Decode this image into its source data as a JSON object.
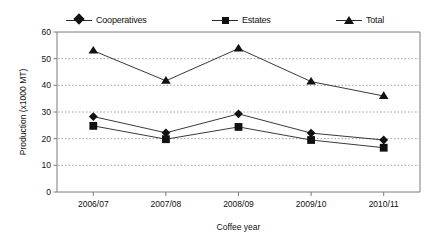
{
  "chart_data": {
    "type": "line",
    "title": "",
    "xlabel": "Coffee year",
    "ylabel": "Production (x1000 MT)",
    "categories": [
      "2006/07",
      "2007/08",
      "2008/09",
      "2009/10",
      "2010/11"
    ],
    "series": [
      {
        "name": "Cooperatives",
        "marker": "diamond",
        "values": [
          28.3,
          22.2,
          29.3,
          22.1,
          19.5
        ]
      },
      {
        "name": "Estates",
        "marker": "square",
        "values": [
          24.8,
          19.8,
          24.4,
          19.5,
          16.6
        ]
      },
      {
        "name": "Total",
        "marker": "triangle",
        "values": [
          53.0,
          41.7,
          53.8,
          41.4,
          36.0
        ]
      }
    ],
    "ylim": [
      0,
      60
    ],
    "ytick_values": [
      0,
      10,
      20,
      30,
      40,
      50,
      60
    ],
    "ytick_labels": [
      "0",
      "10",
      "20",
      "30",
      "40",
      "50",
      "60"
    ],
    "grid": true,
    "grid_axis": "y",
    "legend_position": "top",
    "colors": {
      "marker": "#111111",
      "line": "#222222",
      "grid": "#9a9a9a",
      "axis": "#7a7a7a",
      "background": "#ffffff",
      "text": "#111111"
    }
  },
  "legend": {
    "items": [
      {
        "label": "Cooperatives",
        "marker": "diamond"
      },
      {
        "label": "Estates",
        "marker": "square"
      },
      {
        "label": "Total",
        "marker": "triangle"
      }
    ]
  },
  "axes": {
    "y_title": "Production (x1000 MT)",
    "x_title": "Coffee year"
  }
}
